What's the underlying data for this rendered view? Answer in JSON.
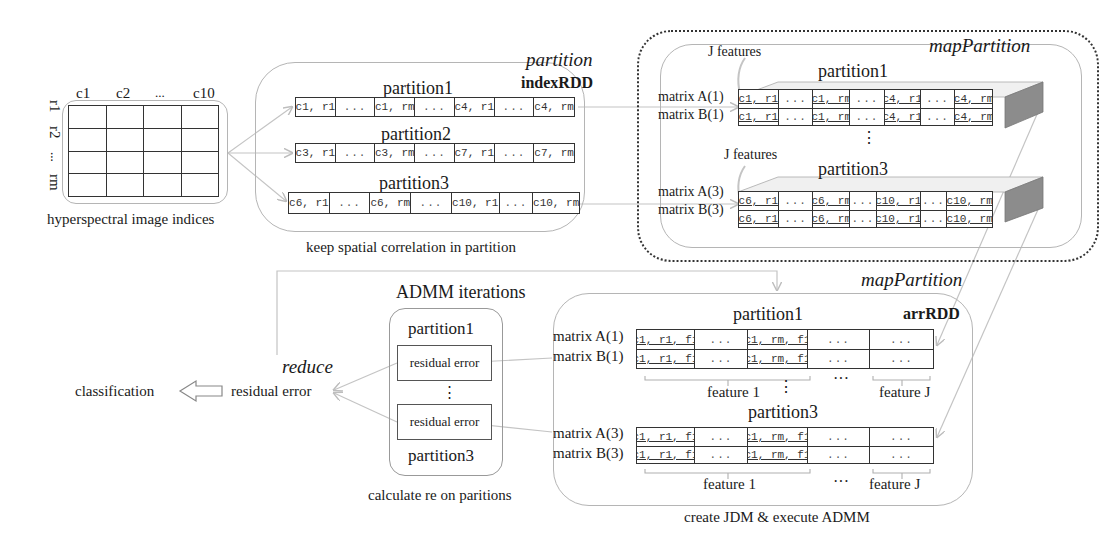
{
  "source_grid": {
    "col_labels": [
      "c1",
      "c2",
      "...",
      "c10"
    ],
    "row_labels": [
      "r1",
      "r2",
      "...",
      "rm"
    ],
    "caption": "hyperspectral image indices"
  },
  "index_stage": {
    "op_label": "partition",
    "rdd_label": "indexRDD",
    "caption": "keep spatial correlation in partition",
    "partitions": [
      {
        "title": "partition1",
        "cells": [
          "c1, r1",
          "...",
          "c1, rm",
          "...",
          "c4, r1",
          "...",
          "c4, rm"
        ]
      },
      {
        "title": "partition2",
        "cells": [
          "c3, r1",
          "...",
          "c3, rm",
          "...",
          "c7, r1",
          "...",
          "c7, rm"
        ]
      },
      {
        "title": "partition3",
        "cells": [
          "c6, r1",
          "...",
          "c6, rm",
          "...",
          "c10, r1",
          "...",
          "c10, rm"
        ]
      }
    ]
  },
  "feature_stage": {
    "op_label": "mapPartition",
    "j_features_label": "J features",
    "vdots": "⋮",
    "partitions": [
      {
        "title": "partition1",
        "matrix_a": "matrix A(1)",
        "matrix_b": "matrix B(1)",
        "cells": [
          "c1, r1",
          "...",
          "c1, rm",
          "...",
          "c4, r1",
          "...",
          "c4, rm"
        ]
      },
      {
        "title": "partition3",
        "matrix_a": "matrix A(3)",
        "matrix_b": "matrix B(3)",
        "cells": [
          "c6, r1",
          "...",
          "c6, rm",
          "...",
          "c10, r1",
          "...",
          "c10, rm"
        ]
      }
    ]
  },
  "arr_stage": {
    "op_label": "mapPartition",
    "rdd_label": "arrRDD",
    "caption": "create JDM & execute ADMM",
    "vdots": "⋮",
    "hdots": "···",
    "partitions": [
      {
        "title": "partition1",
        "matrix_a": "matrix A(1)",
        "matrix_b": "matrix B(1)",
        "cells": [
          "c1, r1, f1",
          "...",
          "c1, rm, f1",
          "...",
          "..."
        ],
        "feature_first": "feature 1",
        "feature_last": "feature J"
      },
      {
        "title": "partition3",
        "matrix_a": "matrix A(3)",
        "matrix_b": "matrix B(3)",
        "cells": [
          "c1, r1, f1",
          "...",
          "c1, rm, f1",
          "...",
          "..."
        ],
        "feature_first": "feature 1",
        "feature_last": "feature J"
      }
    ]
  },
  "admm_stage": {
    "title": "ADMM iterations",
    "partition_top": "partition1",
    "partition_bottom": "partition3",
    "residual_top": "residual error",
    "residual_bottom": "residual error",
    "vdots": "⋮",
    "caption": "calculate re on paritions"
  },
  "reduce_stage": {
    "op_label": "reduce",
    "result": "residual error",
    "output": "classification"
  },
  "colors": {
    "line": "#333333",
    "connector": "#bdbdbd",
    "box_border": "#b5b5b5",
    "slab_shade": "#8c8c8c"
  }
}
